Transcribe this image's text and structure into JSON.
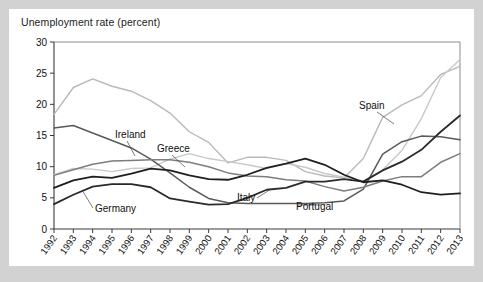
{
  "figure": {
    "title": "Unemployment rate (percent)",
    "background": "#ffffff",
    "page_background": "#d2d2d2"
  },
  "chart_data": {
    "type": "line",
    "title": "Unemployment rate (percent)",
    "xlabel": "",
    "ylabel": "",
    "ylim": [
      0,
      30
    ],
    "yticks": [
      0,
      5,
      10,
      15,
      20,
      25,
      30
    ],
    "grid": false,
    "legend": "inline-annotations",
    "categories": [
      "1992",
      "1993",
      "1994",
      "1995",
      "1996",
      "1997",
      "1998",
      "1999",
      "2000",
      "2001",
      "2002",
      "2003",
      "2004",
      "2005",
      "2006",
      "2007",
      "2008",
      "2009",
      "2010",
      "2011",
      "2012",
      "2013"
    ],
    "series": [
      {
        "name": "Spain",
        "color": "#b9b9b9",
        "width": 1.4,
        "values": [
          18.4,
          22.7,
          24.1,
          22.9,
          22.1,
          20.6,
          18.6,
          15.6,
          13.9,
          10.6,
          11.5,
          11.5,
          11.0,
          9.2,
          8.5,
          8.2,
          11.3,
          17.9,
          19.9,
          21.4,
          24.8,
          26.1
        ]
      },
      {
        "name": "Greece",
        "color": "#c9c9c9",
        "width": 1.4,
        "values": [
          8.7,
          9.7,
          9.6,
          9.2,
          9.7,
          9.8,
          11.2,
          12.1,
          11.3,
          10.8,
          10.3,
          9.7,
          10.5,
          9.9,
          8.9,
          8.3,
          7.7,
          9.5,
          12.6,
          17.7,
          24.3,
          27.2
        ]
      },
      {
        "name": "Ireland",
        "color": "#595959",
        "width": 1.5,
        "values": [
          16.2,
          16.6,
          15.4,
          14.2,
          13.0,
          11.2,
          9.0,
          6.7,
          4.9,
          4.2,
          4.1,
          4.1,
          4.1,
          4.1,
          4.2,
          4.5,
          6.4,
          12.0,
          14.0,
          14.9,
          14.8,
          14.3
        ]
      },
      {
        "name": "Italy",
        "color": "#7d7d7d",
        "width": 1.5,
        "values": [
          8.6,
          9.5,
          10.4,
          10.9,
          11.0,
          11.1,
          11.1,
          10.7,
          10.0,
          9.0,
          8.5,
          8.4,
          7.9,
          7.7,
          6.8,
          6.1,
          6.7,
          7.7,
          8.4,
          8.4,
          10.7,
          12.1
        ]
      },
      {
        "name": "Portugal",
        "color": "#2a2a2a",
        "width": 1.8,
        "values": [
          4.0,
          5.5,
          6.8,
          7.2,
          7.2,
          6.7,
          4.9,
          4.4,
          3.9,
          4.0,
          5.0,
          6.3,
          6.6,
          7.6,
          7.6,
          8.0,
          7.6,
          9.4,
          10.8,
          12.7,
          15.6,
          18.2
        ]
      },
      {
        "name": "Germany",
        "color": "#1f1f1f",
        "width": 1.8,
        "values": [
          6.6,
          7.8,
          8.4,
          8.2,
          8.9,
          9.7,
          9.4,
          8.6,
          8.0,
          7.9,
          8.7,
          9.8,
          10.5,
          11.3,
          10.3,
          8.7,
          7.5,
          7.8,
          7.1,
          5.9,
          5.5,
          5.7
        ]
      }
    ],
    "annotations": [
      {
        "label": "Ireland",
        "text_x": 106,
        "text_y": 129,
        "leader": [
          [
            118,
            132
          ],
          [
            126,
            147
          ]
        ]
      },
      {
        "label": "Greece",
        "text_x": 148,
        "text_y": 143,
        "leader": [
          [
            163,
            146
          ],
          [
            176,
            158
          ]
        ]
      },
      {
        "label": "Italy",
        "text_x": 228,
        "text_y": 192,
        "leader": [
          [
            248,
            189
          ],
          [
            262,
            180
          ]
        ]
      },
      {
        "label": "Portugal",
        "text_x": 287,
        "text_y": 201,
        "leader": [
          [
            288,
            196
          ],
          [
            312,
            196
          ]
        ]
      },
      {
        "label": "Spain",
        "text_x": 350,
        "text_y": 100,
        "leader": [
          [
            368,
            103
          ],
          [
            385,
            115
          ]
        ]
      },
      {
        "label": "Germany",
        "text_x": 86,
        "text_y": 203,
        "leader": [
          [
            84,
            199
          ],
          [
            73,
            181
          ]
        ]
      }
    ]
  }
}
